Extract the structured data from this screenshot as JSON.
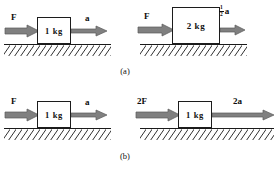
{
  "figure": {
    "width": 276,
    "height": 170,
    "background": "#ffffff",
    "arrow_color": "#808080",
    "arrow_outline": "#4d4d4d",
    "block_fill": "#ffffff",
    "block_border": "#1c1c1c",
    "ground_color": "#1a1a1a",
    "text_color": "#0d0d0d"
  },
  "rows": [
    {
      "caption": "(a)",
      "panels": [
        {
          "name": "panel-a-left",
          "force_label": "F",
          "block_label": "1 kg",
          "accel_label": "a"
        },
        {
          "name": "panel-a-right",
          "force_label": "F",
          "block_label": "2 kg",
          "accel_numerator": "1",
          "accel_denominator": "2",
          "accel_symbol": "a"
        }
      ]
    },
    {
      "caption": "(b)",
      "panels": [
        {
          "name": "panel-b-left",
          "force_label": "F",
          "block_label": "1 kg",
          "accel_label": "a"
        },
        {
          "name": "panel-b-right",
          "force_label": "2F",
          "block_label": "1 kg",
          "accel_label": "2a"
        }
      ]
    }
  ]
}
